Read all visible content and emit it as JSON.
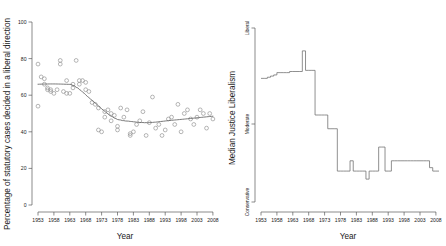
{
  "figure": {
    "panels": [
      "scatter-statutory-liberalism",
      "median-justice-liberalism"
    ]
  },
  "chart_data": [
    {
      "type": "scatter",
      "title": "",
      "xlabel": "Year",
      "ylabel": "Percentage of statutory cases decided in a liberal direction",
      "xlim": [
        1952,
        2009
      ],
      "ylim": [
        0,
        100
      ],
      "xticks": [
        1953,
        1958,
        1963,
        1968,
        1973,
        1978,
        1983,
        1988,
        1993,
        1998,
        2003,
        2008
      ],
      "yticks": [
        0,
        20,
        40,
        60,
        80,
        100
      ],
      "grid": false,
      "legend": null,
      "marker": "open-circle",
      "x": [
        1953,
        1953,
        1954,
        1955,
        1955,
        1956,
        1956,
        1957,
        1957,
        1958,
        1959,
        1960,
        1960,
        1961,
        1962,
        1962,
        1963,
        1964,
        1964,
        1965,
        1966,
        1966,
        1967,
        1968,
        1968,
        1969,
        1970,
        1971,
        1972,
        1972,
        1973,
        1974,
        1974,
        1975,
        1976,
        1976,
        1977,
        1978,
        1978,
        1979,
        1980,
        1981,
        1982,
        1982,
        1983,
        1984,
        1985,
        1986,
        1987,
        1988,
        1989,
        1990,
        1991,
        1992,
        1993,
        1994,
        1995,
        1996,
        1997,
        1998,
        1999,
        2000,
        2001,
        2002,
        2003,
        2004,
        2005,
        2006,
        2007,
        2008
      ],
      "y": [
        77,
        54,
        70,
        69,
        66,
        64,
        63,
        63,
        62,
        61,
        63,
        79,
        77,
        62,
        68,
        61,
        61,
        64,
        66,
        79,
        68,
        66,
        68,
        67,
        63,
        62,
        56,
        55,
        41,
        53,
        40,
        51,
        48,
        52,
        50,
        46,
        49,
        43,
        41,
        53,
        48,
        52,
        38,
        39,
        40,
        44,
        46,
        51,
        38,
        45,
        59,
        42,
        44,
        38,
        41,
        47,
        48,
        44,
        55,
        40,
        50,
        52,
        47,
        44,
        48,
        52,
        50,
        42,
        50,
        47
      ],
      "fit_curve_note": "LOESS-style smoothed trend starting near 74% in 1953, declining to about 45% by 1983, then flat at about 45% through 2008"
    },
    {
      "type": "line",
      "title": "",
      "xlabel": "Year",
      "ylabel": "Median Justice Liberalism",
      "xlim": [
        1952,
        2009
      ],
      "ylim": [
        0,
        1
      ],
      "xticks": [
        1953,
        1958,
        1963,
        1968,
        1973,
        1978,
        1983,
        1988,
        1993,
        1998,
        2003,
        2008
      ],
      "ytick_labels": [
        "Conservative",
        "Moderate",
        "Liberal"
      ],
      "ytick_values": [
        0.12,
        0.5,
        0.88
      ],
      "grid": false,
      "legend": null,
      "line_style": "step",
      "x": [
        1953,
        1954,
        1955,
        1956,
        1957,
        1958,
        1959,
        1960,
        1961,
        1962,
        1963,
        1964,
        1965,
        1966,
        1967,
        1968,
        1969,
        1970,
        1971,
        1972,
        1973,
        1974,
        1975,
        1976,
        1977,
        1978,
        1979,
        1980,
        1981,
        1982,
        1983,
        1984,
        1985,
        1986,
        1987,
        1988,
        1989,
        1990,
        1991,
        1992,
        1993,
        1994,
        1995,
        1996,
        1997,
        1998,
        1999,
        2000,
        2001,
        2002,
        2003,
        2004,
        2005,
        2006,
        2007,
        2008
      ],
      "y": [
        0.66,
        0.66,
        0.665,
        0.67,
        0.675,
        0.685,
        0.685,
        0.685,
        0.685,
        0.69,
        0.69,
        0.69,
        0.69,
        0.78,
        0.695,
        0.695,
        0.695,
        0.5,
        0.5,
        0.5,
        0.5,
        0.44,
        0.44,
        0.44,
        0.255,
        0.255,
        0.255,
        0.255,
        0.3,
        0.255,
        0.255,
        0.255,
        0.255,
        0.22,
        0.255,
        0.255,
        0.255,
        0.36,
        0.36,
        0.255,
        0.255,
        0.3,
        0.3,
        0.3,
        0.3,
        0.3,
        0.3,
        0.3,
        0.3,
        0.3,
        0.3,
        0.3,
        0.3,
        0.27,
        0.255,
        0.255
      ]
    }
  ]
}
